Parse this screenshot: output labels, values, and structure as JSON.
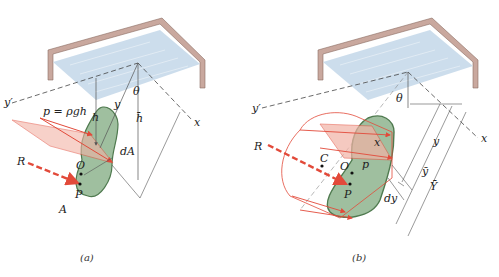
{
  "figure": {
    "topic": "Hydrostatic pressure on a submerged inclined plane surface",
    "panels": [
      {
        "id": "a",
        "caption": "(a)",
        "labels": {
          "y_prime": "y′",
          "x_axis": "x",
          "theta": "θ",
          "y": "y",
          "h": "h",
          "h_bar": "h̄",
          "pressure": "p = ρgh",
          "dA": "dA",
          "R": "R",
          "O": "O",
          "P": "P",
          "A": "A"
        }
      },
      {
        "id": "b",
        "caption": "(b)",
        "labels": {
          "y_prime": "y′",
          "x_axis": "x",
          "theta": "θ",
          "R": "R",
          "C": "C",
          "O": "O",
          "P": "P",
          "p": "p",
          "x": "x",
          "y": "y",
          "y_bar": "ȳ",
          "Y_bar": "Ȳ",
          "dy": "dy"
        }
      }
    ],
    "colors": {
      "tank_wall": "#c9a89e",
      "water": "#c6d9ea",
      "plate": "#9fbf9f",
      "plate_edge": "#4f7a4f",
      "pressure": "#e24a3a",
      "pressure_fill": "#f2b3a6",
      "lines": "#666666"
    }
  }
}
